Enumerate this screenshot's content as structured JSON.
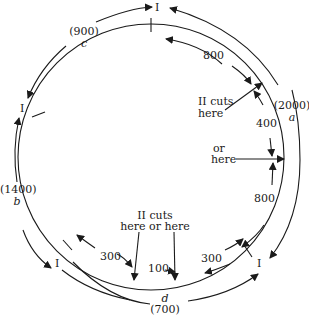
{
  "diagram": {
    "outer_arcs": [
      {
        "id": "a",
        "letter": "a",
        "value": "(2000)"
      },
      {
        "id": "b",
        "letter": "b",
        "value": "(1400)"
      },
      {
        "id": "c",
        "letter": "c",
        "value": "(900)"
      },
      {
        "id": "d",
        "letter": "d",
        "value": "(700)"
      }
    ],
    "cut_I_labels": [
      "I",
      "I",
      "I",
      "I"
    ],
    "inner_segments": [
      "800",
      "400",
      "800",
      "300",
      "100",
      "300"
    ],
    "annotations": {
      "cut_here": [
        "II cuts",
        "here"
      ],
      "or_here": [
        "or",
        "here"
      ],
      "cut_here_or_here": [
        "II cuts",
        "here or here"
      ]
    },
    "colors": {
      "ink": "#1a1a1a",
      "background": "#ffffff"
    }
  }
}
